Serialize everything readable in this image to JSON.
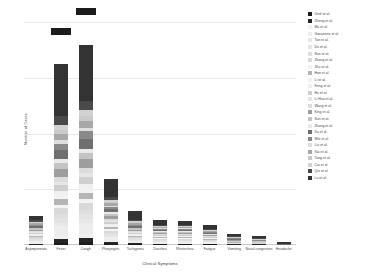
{
  "chart_data": {
    "type": "bar",
    "title": "",
    "subtype": "stacked",
    "xlabel": "Clinical Symptoms",
    "ylabel": "Number of Cases",
    "ylim": [
      0,
      400
    ],
    "yticks": [
      0,
      100,
      200,
      300,
      400
    ],
    "ytick_labels": [
      "0",
      "100",
      "200",
      "300",
      "400"
    ],
    "grid": true,
    "legend_position": "right",
    "categories": [
      "Asymptomatic",
      "Fever",
      "Cough",
      "Pharyngitis",
      "Tachypnea",
      "Diarrhea",
      "Rhinorrhea",
      "Fatigue",
      "Vomiting",
      "Nasal congestion",
      "Headache"
    ],
    "totals": [
      52,
      320,
      350,
      120,
      62,
      45,
      42,
      36,
      20,
      17,
      6
    ],
    "series": [
      {
        "name": "Deol et al.",
        "color": "#1c1c1c",
        "values": [
          0,
          4,
          5,
          2,
          1,
          1,
          1,
          1,
          0,
          0,
          0
        ]
      },
      {
        "name": "Zheng et al.",
        "color": "#262626",
        "values": [
          2,
          7,
          8,
          3,
          2,
          1,
          1,
          1,
          1,
          1,
          0
        ]
      },
      {
        "name": "Ma et al.",
        "color": "#f0f0f0",
        "values": [
          1,
          6,
          7,
          2,
          1,
          1,
          1,
          1,
          0,
          0,
          0
        ]
      },
      {
        "name": "Garazzino et al.",
        "color": "#ededed",
        "values": [
          4,
          18,
          20,
          7,
          4,
          3,
          3,
          2,
          1,
          1,
          0
        ]
      },
      {
        "name": "Tan et al.",
        "color": "#e8e8e8",
        "values": [
          1,
          5,
          6,
          2,
          1,
          1,
          1,
          1,
          0,
          0,
          0
        ]
      },
      {
        "name": "Du et al.",
        "color": "#e3e3e3",
        "values": [
          2,
          9,
          10,
          3,
          2,
          1,
          1,
          1,
          1,
          0,
          0
        ]
      },
      {
        "name": "Sun et al.",
        "color": "#dedede",
        "values": [
          1,
          6,
          7,
          2,
          1,
          1,
          1,
          1,
          0,
          0,
          0
        ]
      },
      {
        "name": "Zhang et al.",
        "color": "#d9d9d9",
        "values": [
          3,
          12,
          13,
          5,
          2,
          2,
          2,
          1,
          1,
          1,
          0
        ]
      },
      {
        "name": "Zhu et al.",
        "color": "#f4f4f4",
        "values": [
          1,
          5,
          6,
          2,
          1,
          1,
          1,
          1,
          0,
          0,
          0
        ]
      },
      {
        "name": "Han et al.",
        "color": "#b5b5b5",
        "values": [
          2,
          10,
          11,
          4,
          2,
          2,
          2,
          1,
          1,
          1,
          0
        ]
      },
      {
        "name": "Li et al.",
        "color": "#f2f2f2",
        "values": [
          1,
          7,
          8,
          3,
          1,
          1,
          1,
          1,
          0,
          0,
          0
        ]
      },
      {
        "name": "Feng et al.",
        "color": "#efefef",
        "values": [
          2,
          8,
          9,
          3,
          2,
          1,
          1,
          1,
          1,
          0,
          0
        ]
      },
      {
        "name": "Hu et al.",
        "color": "#cfcfcf",
        "values": [
          2,
          11,
          12,
          4,
          2,
          2,
          2,
          1,
          1,
          1,
          0
        ]
      },
      {
        "name": "Li Hua et al.",
        "color": "#e6e6e6",
        "values": [
          1,
          6,
          7,
          2,
          1,
          1,
          1,
          1,
          0,
          0,
          0
        ]
      },
      {
        "name": "Wang et al.",
        "color": "#dcdcdc",
        "values": [
          2,
          9,
          10,
          3,
          2,
          1,
          1,
          1,
          1,
          0,
          0
        ]
      },
      {
        "name": "King et al.",
        "color": "#9e9e9e",
        "values": [
          3,
          14,
          15,
          5,
          3,
          2,
          2,
          2,
          1,
          1,
          0
        ]
      },
      {
        "name": "Sun et al.",
        "color": "#c4c4c4",
        "values": [
          2,
          10,
          11,
          4,
          2,
          2,
          2,
          1,
          1,
          1,
          0
        ]
      },
      {
        "name": "Zhang et al.",
        "color": "#eaeaea",
        "values": [
          1,
          7,
          8,
          3,
          1,
          1,
          1,
          1,
          0,
          0,
          0
        ]
      },
      {
        "name": "Xu et al.",
        "color": "#6f6f6f",
        "values": [
          3,
          16,
          18,
          6,
          3,
          2,
          2,
          2,
          1,
          1,
          1
        ]
      },
      {
        "name": "Wei et al.",
        "color": "#8a8a8a",
        "values": [
          2,
          12,
          13,
          4,
          2,
          2,
          2,
          1,
          1,
          1,
          0
        ]
      },
      {
        "name": "Liu et al.",
        "color": "#dfdfdf",
        "values": [
          1,
          6,
          7,
          2,
          1,
          1,
          1,
          1,
          0,
          0,
          0
        ]
      },
      {
        "name": "Xia et al.",
        "color": "#a8a8a8",
        "values": [
          2,
          11,
          12,
          4,
          2,
          2,
          2,
          1,
          1,
          1,
          0
        ]
      },
      {
        "name": "Tang et al.",
        "color": "#cacaca",
        "values": [
          1,
          8,
          9,
          3,
          2,
          1,
          1,
          1,
          1,
          0,
          0
        ]
      },
      {
        "name": "Cai et al.",
        "color": "#d2d2d2",
        "values": [
          2,
          9,
          10,
          3,
          2,
          1,
          1,
          1,
          1,
          1,
          0
        ]
      },
      {
        "name": "Qiu et al.",
        "color": "#4a4a4a",
        "values": [
          3,
          15,
          17,
          6,
          3,
          2,
          2,
          2,
          1,
          1,
          1
        ]
      },
      {
        "name": "Lu et al.",
        "color": "#333333",
        "values": [
          7,
          94,
          101,
          32,
          16,
          10,
          8,
          7,
          4,
          4,
          3
        ]
      }
    ],
    "annotations": [
      {
        "category": "Fever",
        "marker": "value-box"
      },
      {
        "category": "Cough",
        "marker": "value-box"
      }
    ]
  }
}
